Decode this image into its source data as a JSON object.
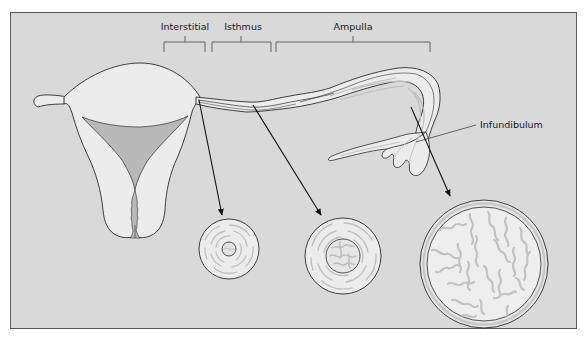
{
  "diagram": {
    "colors": {
      "background": "#d9d9d9",
      "frame": "#555555",
      "tissue_fill": "#ececec",
      "cavity_fill": "#b9b9b9",
      "mucosa_fold": "#bdbdbd",
      "outline": "#2b2b2b",
      "arrow": "#111111"
    },
    "segment_labels": [
      {
        "id": "interstitial",
        "text": "Interstitial"
      },
      {
        "id": "isthmus",
        "text": "Isthmus"
      },
      {
        "id": "ampulla",
        "text": "Ampulla"
      }
    ],
    "callouts": [
      {
        "id": "infundibulum",
        "text": "Infundibulum"
      }
    ],
    "cross_sections": [
      {
        "segment": "Interstitial",
        "cx": 229,
        "cy": 249,
        "r": 30,
        "lumen_r": 7
      },
      {
        "segment": "Isthmus",
        "cx": 343,
        "cy": 256,
        "r": 38,
        "lumen_r": 17
      },
      {
        "segment": "Ampulla",
        "cx": 484,
        "cy": 264,
        "r": 64,
        "lumen_r": 57
      }
    ]
  }
}
